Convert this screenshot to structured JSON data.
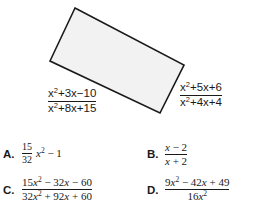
{
  "figure": {
    "shape": "rectangle",
    "fill_color": "#f2f2f2",
    "stroke_color": "#1a1a1a",
    "corners": [
      [
        75,
        8
      ],
      [
        184,
        65
      ],
      [
        160,
        113
      ],
      [
        50,
        61
      ]
    ],
    "left_side_label": {
      "numerator": "x²+3x−10",
      "denominator": "x²+8x+15"
    },
    "right_side_label": {
      "numerator": "x²+5x+6",
      "denominator": "x²+4x+4"
    }
  },
  "options": [
    {
      "label": "A.",
      "coefficient_numerator": "15",
      "coefficient_denominator": "32",
      "tail": "x² − 1"
    },
    {
      "label": "B.",
      "numerator": "x − 2",
      "denominator": "x + 2"
    },
    {
      "label": "C.",
      "numerator": "15x² − 32x − 60",
      "denominator": "32x² + 92x + 60"
    },
    {
      "label": "D.",
      "numerator": "9x² − 42x + 49",
      "denominator": "16x²"
    }
  ]
}
